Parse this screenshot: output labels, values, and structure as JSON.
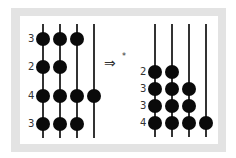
{
  "diagram": {
    "arrow": "⇒",
    "arrow_mark": "*",
    "left_abacus": {
      "rows": [
        {
          "label": "3",
          "beads": 3
        },
        {
          "label": "2",
          "beads": 2
        },
        {
          "label": "4",
          "beads": 4
        },
        {
          "label": "3",
          "beads": 3
        }
      ],
      "rod_count": 4
    },
    "right_abacus": {
      "rows": [
        {
          "label": "2",
          "beads": 2
        },
        {
          "label": "3",
          "beads": 3
        },
        {
          "label": "3",
          "beads": 3
        },
        {
          "label": "4",
          "beads": 4
        }
      ],
      "rod_count": 4
    },
    "colors": {
      "bead": "#0a0a0a",
      "rod": "#333333",
      "frame": "#e3e3e3"
    }
  }
}
